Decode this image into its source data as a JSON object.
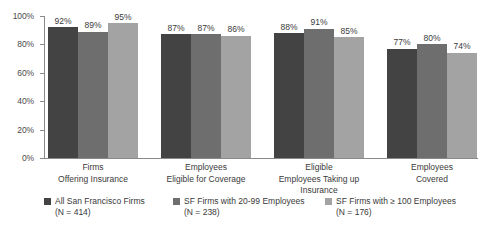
{
  "chart_data": {
    "type": "bar",
    "title": "",
    "subtitle": "",
    "xlabel": "",
    "ylabel": "",
    "ylim": [
      0,
      100
    ],
    "grid": false,
    "legend_position": "bottom",
    "value_suffix": "%",
    "categories": [
      "Firms\nOffering Insurance",
      "Employees\nEligible for Coverage",
      "Eligible\nEmployees Taking up\nInsurance",
      "Employees\nCovered"
    ],
    "category_lines": [
      [
        "Firms",
        "Offering Insurance"
      ],
      [
        "Employees",
        "Eligible for Coverage"
      ],
      [
        "Eligible",
        "Employees Taking up",
        "Insurance"
      ],
      [
        "Employees",
        "Covered"
      ]
    ],
    "yticks": [
      "0%",
      "20%",
      "40%",
      "60%",
      "80%",
      "100%"
    ],
    "ytick_values": [
      0,
      20,
      40,
      60,
      80,
      100
    ],
    "series": [
      {
        "name": "All San Francisco Firms",
        "n_label": "(N = 414)",
        "color": "#434343",
        "values": [
          92,
          87,
          88,
          77
        ],
        "labels": [
          "92%",
          "87%",
          "88%",
          "77%"
        ]
      },
      {
        "name": "SF Firms with 20-99 Employees",
        "n_label": "(N = 238)",
        "color": "#6e6e6e",
        "values": [
          89,
          87,
          91,
          80
        ],
        "labels": [
          "89%",
          "87%",
          "91%",
          "80%"
        ]
      },
      {
        "name": "SF Firms with ≥ 100 Employees",
        "n_label": "(N = 176)",
        "color": "#a3a3a3",
        "values": [
          95,
          86,
          85,
          74
        ],
        "labels": [
          "95%",
          "86%",
          "85%",
          "74%"
        ]
      }
    ]
  }
}
